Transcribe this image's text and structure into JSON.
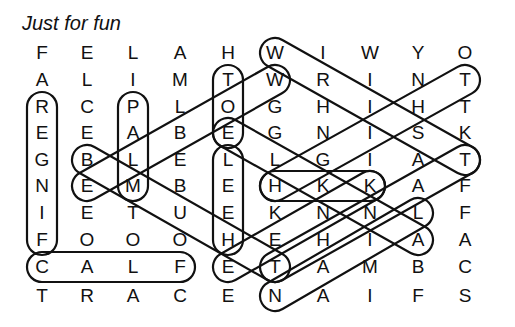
{
  "title": "Just for fun",
  "grid": [
    [
      "F",
      "E",
      "L",
      "A",
      "H",
      "W",
      "I",
      "W",
      "Y",
      "O"
    ],
    [
      "A",
      "L",
      "I",
      "M",
      "T",
      "W",
      "R",
      "I",
      "N",
      "T"
    ],
    [
      "R",
      "C",
      "P",
      "L",
      "O",
      "G",
      "H",
      "I",
      "H",
      "T"
    ],
    [
      "E",
      "E",
      "A",
      "B",
      "E",
      "G",
      "N",
      "I",
      "S",
      "K"
    ],
    [
      "G",
      "B",
      "L",
      "E",
      "L",
      "L",
      "G",
      "I",
      "A",
      "T"
    ],
    [
      "N",
      "E",
      "M",
      "B",
      "E",
      "H",
      "K",
      "K",
      "A",
      "F"
    ],
    [
      "I",
      "E",
      "T",
      "U",
      "E",
      "K",
      "N",
      "N",
      "L",
      "F"
    ],
    [
      "F",
      "O",
      "O",
      "O",
      "H",
      "E",
      "H",
      "I",
      "A",
      "A"
    ],
    [
      "C",
      "A",
      "L",
      "F",
      "E",
      "T",
      "A",
      "M",
      "B",
      "C"
    ],
    [
      "T",
      "R",
      "A",
      "C",
      "E",
      "N",
      "A",
      "I",
      "F",
      "S"
    ]
  ],
  "found_words": [
    {
      "word": "FINGER",
      "from": [
        3,
        1
      ],
      "to": [
        8,
        1
      ]
    },
    {
      "word": "CALF",
      "from": [
        9,
        1
      ],
      "to": [
        9,
        4
      ]
    },
    {
      "word": "PALM",
      "from": [
        3,
        3
      ],
      "to": [
        6,
        3
      ]
    },
    {
      "word": "TOE",
      "from": [
        2,
        5
      ],
      "to": [
        4,
        5
      ]
    },
    {
      "word": "HEEL",
      "from": [
        5,
        5
      ],
      "to": [
        8,
        5
      ]
    },
    {
      "word": "WRIST",
      "from": [
        1,
        6
      ],
      "to": [
        5,
        10
      ]
    },
    {
      "word": "ELBOW",
      "from": [
        6,
        2
      ],
      "to": [
        2,
        6
      ]
    },
    {
      "word": "THUMB",
      "from": [
        5,
        2
      ],
      "to": [
        9,
        6
      ]
    },
    {
      "word": "ANKLE",
      "from": [
        4,
        5
      ],
      "to": [
        8,
        9
      ]
    },
    {
      "word": "THIGH",
      "from": [
        2,
        10
      ],
      "to": [
        6,
        6
      ]
    },
    {
      "word": "KNEE",
      "from": [
        6,
        8
      ],
      "to": [
        9,
        5
      ]
    },
    {
      "word": "NAIL",
      "from": [
        10,
        6
      ],
      "to": [
        7,
        9
      ]
    },
    {
      "word": "HKK",
      "from": [
        6,
        6
      ],
      "to": [
        6,
        8
      ]
    },
    {
      "word": "TEETH",
      "from": [
        9,
        6
      ],
      "to": [
        5,
        10
      ]
    }
  ]
}
